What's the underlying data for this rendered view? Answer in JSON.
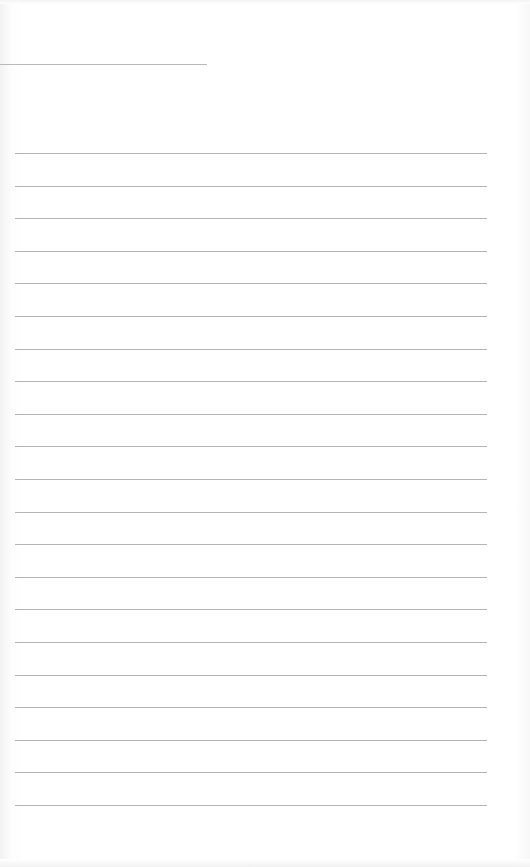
{
  "document": {
    "type": "lined-notepaper",
    "header_rule": {
      "y": 64,
      "x_start": 0,
      "x_end": 207
    },
    "ruled_lines": {
      "count": 21,
      "first_y": 153,
      "spacing": 32.6,
      "x_start": 15,
      "x_end": 487,
      "color": "#b4b4b4"
    },
    "lines": [
      "",
      "",
      "",
      "",
      "",
      "",
      "",
      "",
      "",
      "",
      "",
      "",
      "",
      "",
      "",
      "",
      "",
      "",
      "",
      "",
      ""
    ],
    "header_text": ""
  }
}
